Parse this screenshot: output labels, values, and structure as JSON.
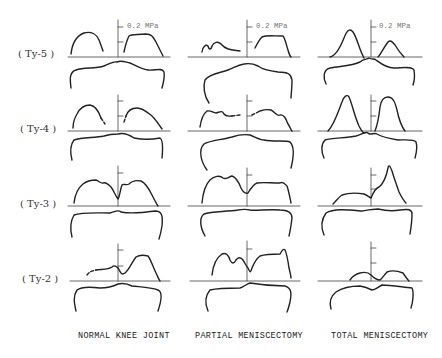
{
  "figure": {
    "type": "contact-pressure-distribution-diagram",
    "unit_label": "0.2 MPa",
    "columns": [
      {
        "id": "normal",
        "label": "NORMAL KNEE JOINT"
      },
      {
        "id": "partial",
        "label": "PARTIAL MENISCECTOMY"
      },
      {
        "id": "total",
        "label": "TOTAL MENISCECTOMY"
      }
    ],
    "rows": [
      {
        "id": "ty5",
        "label": "( Ty-5 )"
      },
      {
        "id": "ty4",
        "label": "( Ty-4 )"
      },
      {
        "id": "ty3",
        "label": "( Ty-3 )"
      },
      {
        "id": "ty2",
        "label": "( Ty-2 )"
      }
    ],
    "scale_ticks_per_axis": 2,
    "tick_value_top": "0.2 MPa"
  }
}
